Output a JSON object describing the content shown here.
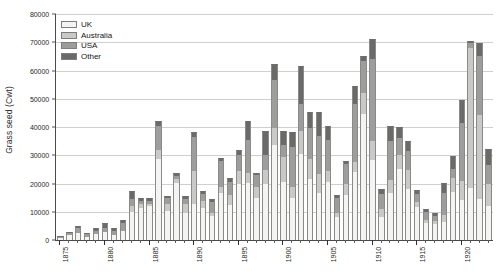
{
  "chart_data": {
    "type": "bar",
    "subtype": "stacked-bar",
    "title": "",
    "xlabel": "",
    "ylabel": "Grass seed (Cwt)",
    "ylim": [
      0,
      80000
    ],
    "ytick_step": 10000,
    "yticks": [
      0,
      10000,
      20000,
      30000,
      40000,
      50000,
      60000,
      70000,
      80000
    ],
    "grid": "horizontal",
    "legend_position": "top-left",
    "legend": [
      "UK",
      "Australia",
      "USA",
      "Other"
    ],
    "series_colors": {
      "UK": "#f4f4f2",
      "Australia": "#c9c9c7",
      "USA": "#9d9d9b",
      "Other": "#6a6a68"
    },
    "xlim": [
      1874.5,
      1923.5
    ],
    "xtick_labels": [
      "1875",
      "1880",
      "1885",
      "1890",
      "1895",
      "1900",
      "1905",
      "1910",
      "1915",
      "1920"
    ],
    "xtick_label_years": [
      1875,
      1880,
      1885,
      1890,
      1895,
      1900,
      1905,
      1910,
      1915,
      1920
    ],
    "categories": [
      1875,
      1876,
      1877,
      1878,
      1879,
      1880,
      1881,
      1882,
      1883,
      1884,
      1885,
      1886,
      1887,
      1888,
      1889,
      1890,
      1891,
      1892,
      1893,
      1894,
      1895,
      1896,
      1897,
      1898,
      1899,
      1900,
      1901,
      1902,
      1903,
      1904,
      1905,
      1906,
      1907,
      1908,
      1909,
      1910,
      1911,
      1912,
      1913,
      1914,
      1915,
      1916,
      1917,
      1918,
      1919,
      1920,
      1921,
      1922,
      1923
    ],
    "series": [
      {
        "name": "UK",
        "values": [
          800,
          1800,
          2600,
          1200,
          2000,
          2900,
          1800,
          3200,
          9800,
          11500,
          12000,
          28800,
          10300,
          20200,
          9700,
          12800,
          11200,
          8500,
          16600,
          12300,
          20000,
          20300,
          15000,
          19900,
          33800,
          20500,
          15000,
          30500,
          21700,
          16800,
          20500,
          8200,
          16000,
          24000,
          44700,
          28200,
          8000,
          16500,
          25000,
          18000,
          11600,
          6000,
          5500,
          6500,
          17000,
          14200,
          18500,
          14400,
          12000
        ]
      },
      {
        "name": "Australia",
        "values": [
          0,
          0,
          0,
          0,
          0,
          0,
          0,
          0,
          2200,
          1200,
          800,
          3000,
          2300,
          1300,
          2900,
          11800,
          2700,
          1000,
          2200,
          3700,
          4600,
          3400,
          3600,
          4900,
          6000,
          9000,
          3800,
          8000,
          7000,
          6700,
          3800,
          1200,
          3900,
          3500,
          7300,
          6800,
          3000,
          4800,
          5200,
          6800,
          2000,
          1200,
          1400,
          2200,
          5000,
          6700,
          49500,
          29800,
          8000
        ]
      },
      {
        "name": "USA",
        "values": [
          200,
          700,
          1500,
          900,
          1200,
          1200,
          1500,
          2800,
          2400,
          1300,
          1000,
          8400,
          2200,
          1100,
          1800,
          12000,
          2500,
          3900,
          9200,
          4700,
          5400,
          11700,
          4400,
          5200,
          16800,
          4200,
          14200,
          9800,
          11000,
          13500,
          11200,
          5500,
          6900,
          20500,
          11300,
          29000,
          5300,
          13600,
          5800,
          6600,
          2700,
          2700,
          1500,
          8000,
          3200,
          20500,
          1600,
          21000,
          6500
        ]
      },
      {
        "name": "Other",
        "values": [
          300,
          400,
          900,
          300,
          1100,
          2000,
          1100,
          1100,
          2800,
          800,
          1200,
          2000,
          900,
          1200,
          1100,
          1800,
          1000,
          1300,
          1000,
          1100,
          2000,
          6800,
          800,
          8500,
          5800,
          4800,
          5200,
          13400,
          5600,
          8300,
          5000,
          1100,
          1200,
          6500,
          1800,
          7000,
          1700,
          5300,
          4000,
          3600,
          1400,
          1000,
          1200,
          3600,
          4500,
          8200,
          1000,
          4600,
          5900
        ]
      }
    ],
    "totals": [
      1300,
      2900,
      5000,
      2400,
      4300,
      6100,
      4400,
      7100,
      17200,
      14800,
      15000,
      42200,
      15700,
      23800,
      15500,
      38400,
      17400,
      14700,
      29000,
      21800,
      32000,
      42200,
      23800,
      38500,
      62400,
      38500,
      38200,
      61700,
      45300,
      45300,
      40500,
      16000,
      28000,
      54500,
      65100,
      71000,
      18000,
      40200,
      40000,
      35000,
      17700,
      10900,
      9600,
      20300,
      29700,
      49600,
      70600,
      69800,
      32400
    ]
  }
}
